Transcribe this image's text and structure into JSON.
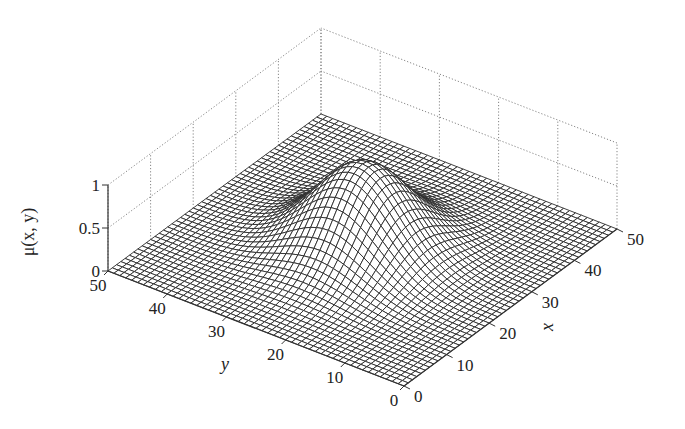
{
  "chart_data": {
    "type": "surface3d",
    "title": "",
    "function": "Gaussian membership surface mu(x,y), peak ~1 at (25,25)",
    "xlabel": "x",
    "ylabel": "y",
    "zlabel": "μ(x, y)",
    "xlim": [
      0,
      50
    ],
    "ylim": [
      0,
      50
    ],
    "zlim": [
      0,
      1
    ],
    "x_ticks": [
      0,
      10,
      20,
      30,
      40,
      50
    ],
    "y_ticks": [
      0,
      10,
      20,
      30,
      40,
      50
    ],
    "z_ticks": [
      0,
      0.5,
      1
    ],
    "x_tick_labels": [
      "0",
      "10",
      "20",
      "30",
      "40",
      "50"
    ],
    "y_tick_labels": [
      "0",
      "10",
      "20",
      "30",
      "40",
      "50"
    ],
    "z_tick_labels": [
      "0",
      "0.5",
      "1"
    ],
    "peak": {
      "x": 25,
      "y": 25,
      "z": 1.0
    },
    "spread_sigma": 7,
    "grid_resolution": 50,
    "grid": "dotted back panes",
    "colors": {
      "mesh_line": "#2a2a2a",
      "mesh_fill": "#ffffff",
      "background": "#ffffff"
    }
  }
}
